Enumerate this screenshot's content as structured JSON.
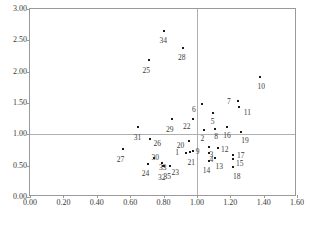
{
  "chart_data": {
    "type": "scatter",
    "title": "",
    "xlabel": "",
    "ylabel": "",
    "xlim": [
      0.0,
      1.6
    ],
    "ylim": [
      0.0,
      3.0
    ],
    "xticks": [
      "0.00",
      "0.20",
      "0.40",
      "0.60",
      "0.80",
      "1.00",
      "1.20",
      "1.40",
      "1.60"
    ],
    "xtick_values": [
      0.0,
      0.2,
      0.4,
      0.6,
      0.8,
      1.0,
      1.2,
      1.4,
      1.6
    ],
    "yticks": [
      "0.00",
      "0.50",
      "1.00",
      "1.50",
      "2.00",
      "2.50",
      "3.00"
    ],
    "ytick_values": [
      0.0,
      0.5,
      1.0,
      1.5,
      2.0,
      2.5,
      3.0
    ],
    "grid": false,
    "legend": "none",
    "reference_lines": {
      "vertical_x": 1.0,
      "horizontal_y": 1.0,
      "color": "#b0b0b0"
    },
    "point_color": "#1a1a1a",
    "labels": [
      "1",
      "2",
      "3",
      "4",
      "5",
      "6",
      "7",
      "8",
      "9",
      "10",
      "11",
      "12",
      "13",
      "14",
      "15",
      "16",
      "17",
      "18",
      "19",
      "20",
      "21",
      "22",
      "23",
      "24",
      "25",
      "26",
      "27",
      "28",
      "29",
      "30",
      "31",
      "32",
      "33",
      "34",
      "35"
    ],
    "points": [
      {
        "label": "1",
        "x": 0.935,
        "y": 0.7,
        "lx": -9,
        "ly": -4
      },
      {
        "label": "2",
        "x": 1.045,
        "y": 1.07,
        "lx": -2,
        "ly": 5
      },
      {
        "label": "3",
        "x": 1.075,
        "y": 0.8,
        "lx": 2,
        "ly": 4
      },
      {
        "label": "4",
        "x": 1.075,
        "y": 0.7,
        "lx": 2,
        "ly": 3
      },
      {
        "label": "5",
        "x": 1.095,
        "y": 1.34,
        "lx": 0,
        "ly": 5
      },
      {
        "label": "6",
        "x": 1.03,
        "y": 1.48,
        "lx": -8,
        "ly": 2
      },
      {
        "label": "7",
        "x": 1.245,
        "y": 1.53,
        "lx": -9,
        "ly": -3
      },
      {
        "label": "8",
        "x": 1.11,
        "y": 1.09,
        "lx": 1,
        "ly": 4
      },
      {
        "label": "9",
        "x": 0.975,
        "y": 0.74,
        "lx": 5,
        "ly": -3
      },
      {
        "label": "10",
        "x": 1.38,
        "y": 1.91,
        "lx": 1,
        "ly": 6
      },
      {
        "label": "11",
        "x": 1.255,
        "y": 1.44,
        "lx": 8,
        "ly": 2
      },
      {
        "label": "12",
        "x": 1.125,
        "y": 0.78,
        "lx": 7,
        "ly": -2
      },
      {
        "label": "13",
        "x": 1.11,
        "y": 0.63,
        "lx": 4,
        "ly": 5
      },
      {
        "label": "14",
        "x": 1.07,
        "y": 0.57,
        "lx": -2,
        "ly": 6
      },
      {
        "label": "15",
        "x": 1.215,
        "y": 0.6,
        "lx": 7,
        "ly": 1
      },
      {
        "label": "16",
        "x": 1.18,
        "y": 1.11,
        "lx": 0,
        "ly": 5
      },
      {
        "label": "17",
        "x": 1.215,
        "y": 0.67,
        "lx": 8,
        "ly": -3
      },
      {
        "label": "18",
        "x": 1.215,
        "y": 0.48,
        "lx": 4,
        "ly": 6
      },
      {
        "label": "19",
        "x": 1.265,
        "y": 1.04,
        "lx": 4,
        "ly": 5
      },
      {
        "label": "20",
        "x": 0.95,
        "y": 0.9,
        "lx": -8,
        "ly": 1
      },
      {
        "label": "21",
        "x": 0.96,
        "y": 0.72,
        "lx": 1,
        "ly": 7
      },
      {
        "label": "22",
        "x": 0.975,
        "y": 1.25,
        "lx": -6,
        "ly": 4
      },
      {
        "label": "23",
        "x": 0.84,
        "y": 0.5,
        "lx": 5,
        "ly": 3
      },
      {
        "label": "24",
        "x": 0.71,
        "y": 0.52,
        "lx": -3,
        "ly": 6
      },
      {
        "label": "25",
        "x": 0.715,
        "y": 2.18,
        "lx": -3,
        "ly": 7
      },
      {
        "label": "26",
        "x": 0.72,
        "y": 0.93,
        "lx": 7,
        "ly": 1
      },
      {
        "label": "27",
        "x": 0.555,
        "y": 0.76,
        "lx": -2,
        "ly": 7
      },
      {
        "label": "28",
        "x": 0.915,
        "y": 2.37,
        "lx": -1,
        "ly": 6
      },
      {
        "label": "29",
        "x": 0.85,
        "y": 1.25,
        "lx": -2,
        "ly": 7
      },
      {
        "label": "30",
        "x": 0.745,
        "y": 0.62,
        "lx": 1,
        "ly": -4
      },
      {
        "label": "31",
        "x": 0.65,
        "y": 1.12,
        "lx": -1,
        "ly": 7
      },
      {
        "label": "32",
        "x": 0.795,
        "y": 0.49,
        "lx": -1,
        "ly": 8
      },
      {
        "label": "33",
        "x": 0.79,
        "y": 0.55,
        "lx": 1,
        "ly": 1
      },
      {
        "label": "34",
        "x": 0.805,
        "y": 2.65,
        "lx": -1,
        "ly": 6
      },
      {
        "label": "35",
        "x": 0.805,
        "y": 0.5,
        "lx": 3,
        "ly": 7
      }
    ]
  },
  "caption": {
    "text": ""
  }
}
